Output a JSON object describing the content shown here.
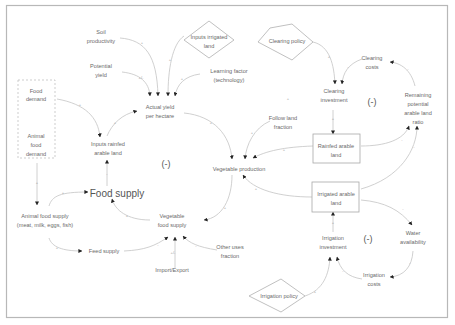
{
  "diagram": {
    "type": "causal-loop-diagram",
    "nodes": {
      "soil_productivity": [
        "Soil",
        "productivity"
      ],
      "inputs_irrigated_land": [
        "Inputs irrigated",
        "land"
      ],
      "clearing_policy": "Clearing policy",
      "potential_yield": [
        "Potential",
        "yield"
      ],
      "learning_factor": [
        "Learning factor",
        "(technology)"
      ],
      "food_demand": [
        "Food",
        "demand"
      ],
      "animal_food_demand": [
        "Animal",
        "food",
        "demand"
      ],
      "actual_yield": [
        "Actual yield",
        "per hectare"
      ],
      "inputs_rainfed": [
        "Inputs rainfed",
        "arable land"
      ],
      "clearing_costs": [
        "Clearing",
        "costs"
      ],
      "clearing_investment": [
        "Clearing",
        "investment"
      ],
      "remaining_potential": [
        "Remaining",
        "potential",
        "arable land",
        "ratio"
      ],
      "follow_land_fraction": [
        "Follow land",
        "fraction"
      ],
      "rainfed_arable_land": [
        "Rainfed arable",
        "land"
      ],
      "vegetable_production": "Vegetable production",
      "food_supply": "Food supply",
      "animal_food_supply": [
        "Animal food supply",
        "(meat, milk, eggs, fish)"
      ],
      "vegetable_food_supply": [
        "Vegetable",
        "food supply"
      ],
      "irrigated_arable_land": [
        "Irrigated arable",
        "land"
      ],
      "feed_supply": "Feed supply",
      "other_uses_fraction": [
        "Other uses",
        "fraction"
      ],
      "import_export": "Import/Export",
      "water_availability": [
        "Water",
        "availability"
      ],
      "irrigation_investment": [
        "Irrigation",
        "investment"
      ],
      "irrigation_costs": [
        "Irrigation",
        "costs"
      ],
      "irrigation_policy": "Irrigation policy"
    },
    "loops": {
      "left": "(-)",
      "clearing": "(-)",
      "irrigation": "(-)"
    },
    "signs": {
      "plus": "+",
      "minus": "-",
      "plus_minus": "+/-"
    },
    "colors": {
      "edge": "#c4c4c4",
      "text": "#6a6a6a",
      "arrowhead": "#222222",
      "frame": "#b8b8b8"
    }
  }
}
